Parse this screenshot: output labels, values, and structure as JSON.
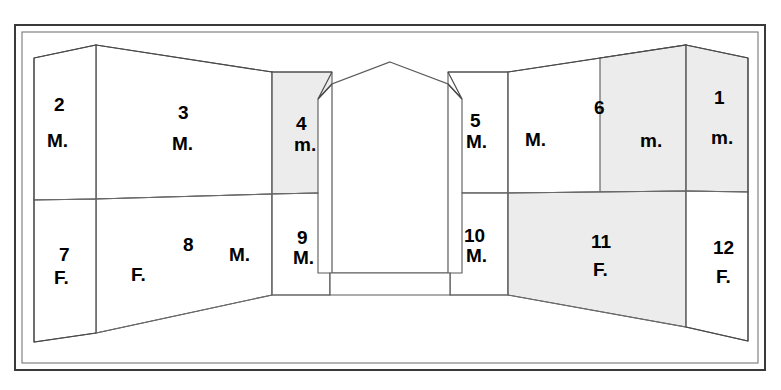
{
  "figure": {
    "type": "architectural-interior-elevation",
    "background_color": "#ffffff",
    "line_color": "#5a5a5a",
    "frame_color": "#3a3a3a",
    "shade_color": "#ececec",
    "registers": [
      "upper",
      "lower"
    ]
  },
  "panels": [
    {
      "id": "panel-1",
      "number": "1",
      "sex": "m.",
      "register": "upper",
      "position": "right-return-wall",
      "shaded": true,
      "num_x": 714,
      "num_y": 88,
      "sex_x": 711,
      "sex_y": 128
    },
    {
      "id": "panel-2",
      "number": "2",
      "sex": "M.",
      "register": "upper",
      "position": "left-return-wall",
      "shaded": false,
      "num_x": 54,
      "num_y": 95,
      "sex_x": 47,
      "sex_y": 131
    },
    {
      "id": "panel-3",
      "number": "3",
      "sex": "M.",
      "register": "upper",
      "position": "left-long-wall",
      "shaded": false,
      "num_x": 178,
      "num_y": 103,
      "sex_x": 172,
      "sex_y": 134
    },
    {
      "id": "panel-4",
      "number": "4",
      "sex": "m.",
      "register": "upper",
      "position": "left-of-niche",
      "shaded": true,
      "num_x": 296,
      "num_y": 114,
      "sex_x": 294,
      "sex_y": 135
    },
    {
      "id": "panel-5",
      "number": "5",
      "sex": "M.",
      "register": "upper",
      "position": "right-of-niche",
      "shaded": false,
      "num_x": 470,
      "num_y": 111,
      "sex_x": 466,
      "sex_y": 132
    },
    {
      "id": "panel-6",
      "number": "6",
      "sex": "M.",
      "sex2": "m.",
      "register": "upper",
      "position": "right-long-wall",
      "shaded": true,
      "num_x": 594,
      "num_y": 98,
      "sex_x": 525,
      "sex_y": 130,
      "sex2_x": 640,
      "sex2_y": 131
    },
    {
      "id": "panel-7",
      "number": "7",
      "sex": "F.",
      "register": "lower",
      "position": "left-return-wall",
      "shaded": false,
      "num_x": 59,
      "num_y": 245,
      "sex_x": 54,
      "sex_y": 268
    },
    {
      "id": "panel-8",
      "number": "8",
      "sex": "F.",
      "sex2": "M.",
      "register": "lower",
      "position": "left-long-wall",
      "shaded": false,
      "num_x": 183,
      "num_y": 235,
      "sex_x": 131,
      "sex_y": 265,
      "sex2_x": 229,
      "sex2_y": 245
    },
    {
      "id": "panel-9",
      "number": "9",
      "sex": "M.",
      "register": "lower",
      "position": "left-of-niche",
      "shaded": false,
      "num_x": 297,
      "num_y": 228,
      "sex_x": 293,
      "sex_y": 248
    },
    {
      "id": "panel-10",
      "number": "10",
      "sex": "M.",
      "register": "lower",
      "position": "right-of-niche",
      "shaded": false,
      "num_x": 464,
      "num_y": 226,
      "sex_x": 466,
      "sex_y": 246
    },
    {
      "id": "panel-11",
      "number": "11",
      "sex": "F.",
      "register": "lower",
      "position": "right-long-wall",
      "shaded": true,
      "num_x": 591,
      "num_y": 232,
      "sex_x": 593,
      "sex_y": 260
    },
    {
      "id": "panel-12",
      "number": "12",
      "sex": "F.",
      "register": "lower",
      "position": "right-return-wall",
      "shaded": false,
      "num_x": 713,
      "num_y": 238,
      "sex_x": 716,
      "sex_y": 267
    }
  ],
  "central_feature": {
    "name": "arched-niche",
    "has_pointed_arch": true,
    "has_plinth": true
  }
}
